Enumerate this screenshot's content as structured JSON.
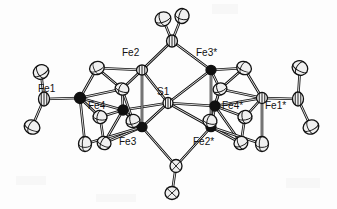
{
  "figure": {
    "kind": "ortep-thermal-ellipsoid-plot",
    "background_color": "#fdfdfd",
    "line_color": "#111111",
    "ellipsoid_fill": "#f0f0f0",
    "dark_atom_fill": "#101010",
    "width": 337,
    "height": 209
  },
  "labels": [
    {
      "id": "fe2",
      "text": "Fe2",
      "x": 122,
      "y": 48
    },
    {
      "id": "fe3star",
      "text": "Fe3*",
      "x": 196,
      "y": 48
    },
    {
      "id": "fe1",
      "text": "Fe1",
      "x": 38,
      "y": 84
    },
    {
      "id": "s1",
      "text": "S1",
      "x": 157,
      "y": 87
    },
    {
      "id": "fe4",
      "text": "Fe4",
      "x": 88,
      "y": 101
    },
    {
      "id": "fe4star",
      "text": "Fe4*",
      "x": 222,
      "y": 101
    },
    {
      "id": "fe1star",
      "text": "Fe1*",
      "x": 265,
      "y": 101
    },
    {
      "id": "fe3",
      "text": "Fe3",
      "x": 119,
      "y": 137
    },
    {
      "id": "fe2star",
      "text": "Fe2*",
      "x": 193,
      "y": 137
    }
  ],
  "atoms": [
    {
      "id": "S1",
      "kind": "sulfur-node",
      "x": 168,
      "y": 103,
      "rx": 5.0,
      "ry": 5.5,
      "rot": 0,
      "style": "striped"
    },
    {
      "id": "Fe2",
      "kind": "iron-node",
      "x": 142,
      "y": 70,
      "rx": 5.5,
      "ry": 5.0,
      "rot": 0,
      "style": "striped"
    },
    {
      "id": "Fe3s",
      "kind": "iron-node-dark",
      "x": 211,
      "y": 70,
      "rx": 5.0,
      "ry": 4.6,
      "rot": 0,
      "style": "dark"
    },
    {
      "id": "Fe3",
      "kind": "iron-node-dark",
      "x": 142,
      "y": 127,
      "rx": 5.0,
      "ry": 4.6,
      "rot": 0,
      "style": "dark"
    },
    {
      "id": "Fe2s",
      "kind": "iron-node-dark",
      "x": 211,
      "y": 127,
      "rx": 5.0,
      "ry": 4.6,
      "rot": 0,
      "style": "dark"
    },
    {
      "id": "Fe1",
      "kind": "iron-node-dark",
      "x": 80,
      "y": 98,
      "rx": 5.5,
      "ry": 5.5,
      "rot": 0,
      "style": "dark"
    },
    {
      "id": "Fe1s",
      "kind": "iron-node",
      "x": 262,
      "y": 98,
      "rx": 5.5,
      "ry": 5.5,
      "rot": 0,
      "style": "striped"
    },
    {
      "id": "Fe4",
      "kind": "iron-node-dark",
      "x": 123,
      "y": 110,
      "rx": 5.0,
      "ry": 5.0,
      "rot": 0,
      "style": "dark"
    },
    {
      "id": "Fe4s",
      "kind": "iron-node-dark",
      "x": 215,
      "y": 106,
      "rx": 5.0,
      "ry": 5.0,
      "rot": 0,
      "style": "dark"
    },
    {
      "id": "CL1",
      "kind": "ligand-ellipsoid",
      "x": 97,
      "y": 68,
      "rx": 7.5,
      "ry": 6.5,
      "rot": -25,
      "style": "ellipsoid"
    },
    {
      "id": "CL2",
      "kind": "ligand-ellipsoid",
      "x": 122,
      "y": 89,
      "rx": 7.0,
      "ry": 6.0,
      "rot": 20,
      "style": "ellipsoid"
    },
    {
      "id": "CL3",
      "kind": "ligand-ellipsoid",
      "x": 100,
      "y": 117,
      "rx": 7.0,
      "ry": 6.5,
      "rot": 10,
      "style": "ellipsoid"
    },
    {
      "id": "CL4",
      "kind": "ligand-ellipsoid",
      "x": 133,
      "y": 121,
      "rx": 7.0,
      "ry": 6.5,
      "rot": -15,
      "style": "ellipsoid"
    },
    {
      "id": "CL5",
      "kind": "ligand-ellipsoid",
      "x": 85,
      "y": 144,
      "rx": 6.5,
      "ry": 7.5,
      "rot": 0,
      "style": "ellipsoid"
    },
    {
      "id": "CL6",
      "kind": "ligand-ellipsoid",
      "x": 104,
      "y": 143,
      "rx": 7.0,
      "ry": 6.5,
      "rot": 25,
      "style": "ellipsoid"
    },
    {
      "id": "CR1",
      "kind": "ligand-ellipsoid",
      "x": 244,
      "y": 68,
      "rx": 7.5,
      "ry": 6.5,
      "rot": 25,
      "style": "ellipsoid"
    },
    {
      "id": "CR2",
      "kind": "ligand-ellipsoid",
      "x": 220,
      "y": 89,
      "rx": 7.0,
      "ry": 6.0,
      "rot": -20,
      "style": "ellipsoid"
    },
    {
      "id": "CR3",
      "kind": "ligand-ellipsoid",
      "x": 245,
      "y": 117,
      "rx": 7.0,
      "ry": 6.5,
      "rot": -10,
      "style": "ellipsoid"
    },
    {
      "id": "CR4",
      "kind": "ligand-ellipsoid",
      "x": 210,
      "y": 121,
      "rx": 7.0,
      "ry": 6.5,
      "rot": 15,
      "style": "ellipsoid"
    },
    {
      "id": "CR5",
      "kind": "ligand-ellipsoid",
      "x": 262,
      "y": 144,
      "rx": 6.5,
      "ry": 7.5,
      "rot": 0,
      "style": "ellipsoid"
    },
    {
      "id": "CR6",
      "kind": "ligand-ellipsoid",
      "x": 241,
      "y": 143,
      "rx": 7.0,
      "ry": 6.5,
      "rot": -25,
      "style": "ellipsoid"
    },
    {
      "id": "TLa",
      "kind": "terminal-ellipsoid",
      "x": 41,
      "y": 72,
      "rx": 8.0,
      "ry": 7.0,
      "rot": -30,
      "style": "ellipsoid"
    },
    {
      "id": "TLm",
      "kind": "terminal-node",
      "x": 44,
      "y": 99,
      "rx": 5.5,
      "ry": 7.0,
      "rot": 0,
      "style": "striped"
    },
    {
      "id": "TLb",
      "kind": "terminal-ellipsoid",
      "x": 32,
      "y": 127,
      "rx": 8.0,
      "ry": 7.0,
      "rot": 25,
      "style": "ellipsoid"
    },
    {
      "id": "TRa",
      "kind": "terminal-ellipsoid",
      "x": 300,
      "y": 68,
      "rx": 8.0,
      "ry": 7.0,
      "rot": 30,
      "style": "ellipsoid"
    },
    {
      "id": "TRm",
      "kind": "terminal-node",
      "x": 298,
      "y": 99,
      "rx": 5.5,
      "ry": 7.0,
      "rot": 0,
      "style": "striped"
    },
    {
      "id": "TRb",
      "kind": "terminal-ellipsoid",
      "x": 311,
      "y": 127,
      "rx": 8.0,
      "ry": 7.0,
      "rot": -25,
      "style": "ellipsoid"
    },
    {
      "id": "TOPm",
      "kind": "bridge-node",
      "x": 172,
      "y": 41,
      "rx": 5.5,
      "ry": 6.0,
      "rot": 0,
      "style": "striped"
    },
    {
      "id": "TOPa",
      "kind": "apical-ellipsoid",
      "x": 163,
      "y": 19,
      "rx": 8.0,
      "ry": 7.0,
      "rot": -20,
      "style": "ellipsoid"
    },
    {
      "id": "TOPb",
      "kind": "apical-ellipsoid",
      "x": 182,
      "y": 16,
      "rx": 7.0,
      "ry": 7.5,
      "rot": 15,
      "style": "ellipsoid"
    },
    {
      "id": "BOTm",
      "kind": "bridge-node",
      "x": 176,
      "y": 166,
      "rx": 6.0,
      "ry": 6.5,
      "rot": 0,
      "style": "crossed"
    },
    {
      "id": "BOTa",
      "kind": "apical-ellipsoid",
      "x": 172,
      "y": 193,
      "rx": 7.0,
      "ry": 6.5,
      "rot": 0,
      "style": "crossed"
    }
  ],
  "bonds": [
    {
      "from": "S1",
      "to": "Fe2"
    },
    {
      "from": "S1",
      "to": "Fe3s"
    },
    {
      "from": "S1",
      "to": "Fe3"
    },
    {
      "from": "S1",
      "to": "Fe2s"
    },
    {
      "from": "S1",
      "to": "Fe4"
    },
    {
      "from": "S1",
      "to": "Fe4s"
    },
    {
      "from": "Fe2",
      "to": "TOPm"
    },
    {
      "from": "Fe3s",
      "to": "TOPm"
    },
    {
      "from": "TOPm",
      "to": "TOPa"
    },
    {
      "from": "TOPm",
      "to": "TOPb"
    },
    {
      "from": "Fe3",
      "to": "BOTm"
    },
    {
      "from": "Fe2s",
      "to": "BOTm"
    },
    {
      "from": "BOTm",
      "to": "BOTa"
    },
    {
      "from": "Fe1",
      "to": "TLm"
    },
    {
      "from": "TLm",
      "to": "TLa"
    },
    {
      "from": "TLm",
      "to": "TLb"
    },
    {
      "from": "Fe1s",
      "to": "TRm"
    },
    {
      "from": "TRm",
      "to": "TRa"
    },
    {
      "from": "TRm",
      "to": "TRb"
    },
    {
      "from": "Fe1",
      "to": "CL1"
    },
    {
      "from": "Fe1",
      "to": "Fe4"
    },
    {
      "from": "Fe1",
      "to": "CL3"
    },
    {
      "from": "Fe1",
      "to": "CL5"
    },
    {
      "from": "Fe1",
      "to": "CL2"
    },
    {
      "from": "CL1",
      "to": "Fe2"
    },
    {
      "from": "CL1",
      "to": "CL2"
    },
    {
      "from": "Fe2",
      "to": "CL2"
    },
    {
      "from": "CL2",
      "to": "Fe4"
    },
    {
      "from": "CL2",
      "to": "CL4"
    },
    {
      "from": "Fe4",
      "to": "CL3"
    },
    {
      "from": "Fe4",
      "to": "CL4"
    },
    {
      "from": "Fe4",
      "to": "CL6"
    },
    {
      "from": "CL3",
      "to": "CL6"
    },
    {
      "from": "CL4",
      "to": "Fe3"
    },
    {
      "from": "CL6",
      "to": "Fe3"
    },
    {
      "from": "CL5",
      "to": "Fe3"
    },
    {
      "from": "Fe4",
      "to": "Fe3"
    },
    {
      "from": "Fe1s",
      "to": "CR1"
    },
    {
      "from": "Fe1s",
      "to": "Fe4s"
    },
    {
      "from": "Fe1s",
      "to": "CR3"
    },
    {
      "from": "Fe1s",
      "to": "CR5"
    },
    {
      "from": "Fe1s",
      "to": "CR2"
    },
    {
      "from": "CR1",
      "to": "Fe3s"
    },
    {
      "from": "CR1",
      "to": "CR2"
    },
    {
      "from": "Fe3s",
      "to": "CR2"
    },
    {
      "from": "CR2",
      "to": "Fe4s"
    },
    {
      "from": "CR2",
      "to": "CR4"
    },
    {
      "from": "Fe4s",
      "to": "CR3"
    },
    {
      "from": "Fe4s",
      "to": "CR4"
    },
    {
      "from": "Fe4s",
      "to": "CR6"
    },
    {
      "from": "CR3",
      "to": "CR6"
    },
    {
      "from": "CR4",
      "to": "Fe2s"
    },
    {
      "from": "CR6",
      "to": "Fe2s"
    },
    {
      "from": "CR5",
      "to": "Fe2s"
    },
    {
      "from": "Fe4s",
      "to": "Fe2s"
    },
    {
      "from": "Fe2",
      "to": "Fe3"
    },
    {
      "from": "Fe3s",
      "to": "Fe2s"
    }
  ]
}
